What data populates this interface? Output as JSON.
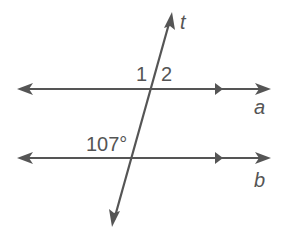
{
  "diagram": {
    "type": "parallel-lines-transversal",
    "colors": {
      "stroke": "#555555",
      "text": "#555555",
      "background": "#ffffff"
    },
    "lines": [
      {
        "name": "a",
        "label": "a",
        "kind": "parallel"
      },
      {
        "name": "b",
        "label": "b",
        "kind": "parallel"
      },
      {
        "name": "t",
        "label": "t",
        "kind": "transversal"
      }
    ],
    "angle_labels": {
      "angle_1": "1",
      "angle_2": "2",
      "given_angle": "107°"
    }
  }
}
